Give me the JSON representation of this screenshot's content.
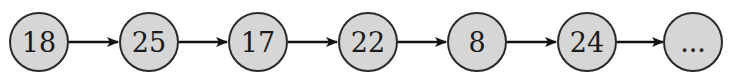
{
  "diagram": {
    "type": "linked-list",
    "nodes": [
      {
        "label": "18"
      },
      {
        "label": "25"
      },
      {
        "label": "17"
      },
      {
        "label": "22"
      },
      {
        "label": "8"
      },
      {
        "label": "24"
      },
      {
        "label": "..."
      }
    ],
    "edges": [
      {
        "from": 0,
        "to": 1
      },
      {
        "from": 1,
        "to": 2
      },
      {
        "from": 2,
        "to": 3
      },
      {
        "from": 3,
        "to": 4
      },
      {
        "from": 4,
        "to": 5
      },
      {
        "from": 5,
        "to": 6
      }
    ],
    "colors": {
      "node_fill": "#d6d6d6",
      "node_stroke": "#2a2a2a",
      "arrow": "#111111",
      "text": "#1a1a1a"
    }
  }
}
